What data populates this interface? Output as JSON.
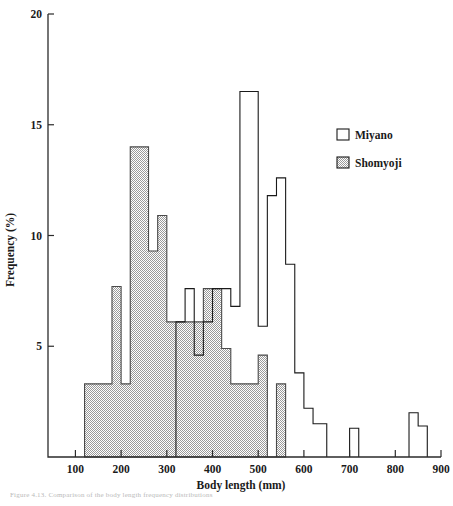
{
  "figure": {
    "caption_partial": "Figure 4.13.  Comparison of the body length frequency distributions"
  },
  "legend": {
    "position": "top-right",
    "entries": [
      {
        "label": "Miyano",
        "swatch": "white"
      },
      {
        "label": "Shomyoji",
        "swatch": "gray-hatched"
      }
    ]
  },
  "axes": {
    "x": {
      "label": "Body  length (mm)",
      "ticks": [
        100,
        200,
        300,
        400,
        500,
        600,
        700,
        800,
        900
      ],
      "min": 40,
      "max": 900
    },
    "y": {
      "label": "Frequency (%)",
      "ticks": [
        5,
        10,
        15,
        20
      ],
      "min": 0,
      "max": 20
    }
  },
  "colors": {
    "ink": "#1a1a1a",
    "axis": "#2b2b2b",
    "miyano_fill": "#ffffff",
    "shomyoji_fill": "#c9c9c9",
    "shomyoji_edge": "#4a4a4a",
    "background": "#ffffff"
  },
  "chart_data": {
    "type": "bar",
    "title": "",
    "subtitle": "",
    "xlabel": "Body  length (mm)",
    "ylabel": "Frequency (%)",
    "xlim": [
      40,
      900
    ],
    "ylim": [
      0,
      20
    ],
    "grid": false,
    "legend_position": "top-right",
    "bin_width": 20,
    "annotations": [],
    "series": [
      {
        "name": "Miyano",
        "style": "open-outline",
        "bins": [
          {
            "x0": 320,
            "x1": 340,
            "value": 6.1
          },
          {
            "x0": 340,
            "x1": 360,
            "value": 7.6
          },
          {
            "x0": 360,
            "x1": 380,
            "value": 4.6
          },
          {
            "x0": 380,
            "x1": 400,
            "value": 6.1
          },
          {
            "x0": 400,
            "x1": 420,
            "value": 7.6
          },
          {
            "x0": 420,
            "x1": 440,
            "value": 7.6
          },
          {
            "x0": 440,
            "x1": 460,
            "value": 6.8
          },
          {
            "x0": 460,
            "x1": 480,
            "value": 16.5
          },
          {
            "x0": 480,
            "x1": 500,
            "value": 16.5
          },
          {
            "x0": 500,
            "x1": 520,
            "value": 5.9
          },
          {
            "x0": 520,
            "x1": 540,
            "value": 11.8
          },
          {
            "x0": 540,
            "x1": 560,
            "value": 12.6
          },
          {
            "x0": 560,
            "x1": 580,
            "value": 8.7
          },
          {
            "x0": 580,
            "x1": 600,
            "value": 3.8
          },
          {
            "x0": 600,
            "x1": 620,
            "value": 2.2
          },
          {
            "x0": 620,
            "x1": 650,
            "value": 1.5
          },
          {
            "x0": 650,
            "x1": 700,
            "value": 0.0
          },
          {
            "x0": 700,
            "x1": 720,
            "value": 1.3
          },
          {
            "x0": 720,
            "x1": 830,
            "value": 0.0
          },
          {
            "x0": 830,
            "x1": 850,
            "value": 2.0
          },
          {
            "x0": 850,
            "x1": 870,
            "value": 1.4
          }
        ]
      },
      {
        "name": "Shomyoji",
        "style": "gray-filled",
        "bins": [
          {
            "x0": 120,
            "x1": 180,
            "value": 3.3
          },
          {
            "x0": 180,
            "x1": 200,
            "value": 7.7
          },
          {
            "x0": 200,
            "x1": 220,
            "value": 3.3
          },
          {
            "x0": 220,
            "x1": 260,
            "value": 14.0
          },
          {
            "x0": 260,
            "x1": 280,
            "value": 9.3
          },
          {
            "x0": 280,
            "x1": 300,
            "value": 10.9
          },
          {
            "x0": 300,
            "x1": 340,
            "value": 6.1
          },
          {
            "x0": 340,
            "x1": 380,
            "value": 6.1
          },
          {
            "x0": 380,
            "x1": 400,
            "value": 7.6
          },
          {
            "x0": 400,
            "x1": 420,
            "value": 7.6
          },
          {
            "x0": 420,
            "x1": 440,
            "value": 4.9
          },
          {
            "x0": 440,
            "x1": 480,
            "value": 3.3
          },
          {
            "x0": 480,
            "x1": 500,
            "value": 3.3
          },
          {
            "x0": 500,
            "x1": 520,
            "value": 4.6
          },
          {
            "x0": 520,
            "x1": 540,
            "value": 0.0
          },
          {
            "x0": 540,
            "x1": 560,
            "value": 3.3
          }
        ]
      }
    ]
  }
}
